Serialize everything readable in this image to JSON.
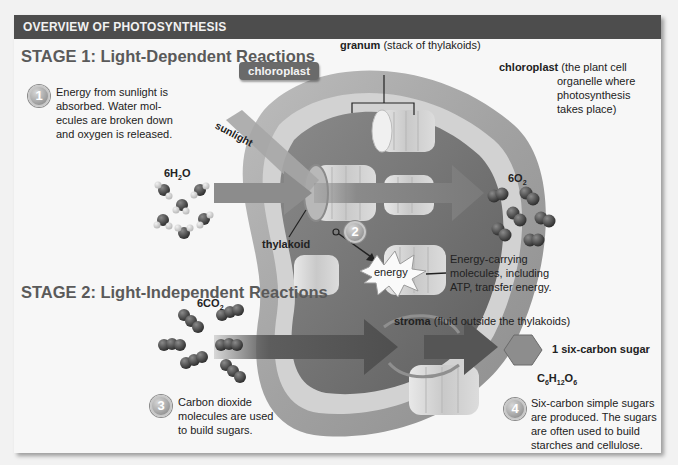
{
  "header": {
    "title": "OVERVIEW OF PHOTOSYNTHESIS"
  },
  "stage1": {
    "title": "STAGE 1: Light-Dependent Reactions",
    "step_number": "1",
    "step_text_lines": [
      "Energy from sunlight is",
      "absorbed. Water mol-",
      "ecules are broken down",
      "and oxygen is released."
    ]
  },
  "stage2": {
    "title": "STAGE 2: Light-Independent Reactions",
    "step_number": "3",
    "step_text_lines": [
      "Carbon dioxide",
      "molecules are used",
      "to build sugars."
    ]
  },
  "step2": {
    "number": "2",
    "energy_label": "energy",
    "description_lines": [
      "Energy-carrying",
      "molecules, including",
      "ATP, transfer energy."
    ]
  },
  "step4": {
    "number": "4",
    "text_lines": [
      "Six-carbon simple sugars",
      "are produced. The sugars",
      "are often used to build",
      "starches and cellulose."
    ]
  },
  "labels": {
    "chloroplast_tag": "chloroplast",
    "chloroplast_term": "chloroplast",
    "chloroplast_def_lines": [
      "(the plant cell",
      "organelle where",
      "photosynthesis",
      "takes place)"
    ],
    "granum_term": "granum",
    "granum_def": "(stack of thylakoids)",
    "thylakoid": "thylakoid",
    "sunlight": "sunlight",
    "stroma_term": "stroma",
    "stroma_def": "(fluid outside the thylakoids)",
    "sugar_label": "1 six-carbon sugar"
  },
  "formulas": {
    "water": {
      "coef": "6H",
      "sub": "2",
      "tail": "O"
    },
    "oxygen": {
      "coef": "6O",
      "sub": "2",
      "tail": ""
    },
    "co2": {
      "coef": "6CO",
      "sub": "2",
      "tail": ""
    },
    "glucose": {
      "c": "C",
      "c_sub": "6",
      "h": "H",
      "h_sub": "12",
      "o": "O",
      "o_sub": "6"
    }
  },
  "colors": {
    "header_bg": "#4d4d4d",
    "panel_bg": "#f7f7f7",
    "stage_title": "#5a5a5a",
    "organelle_outer": "#9a9a9a",
    "organelle_inner": "#6e6e6e",
    "arrow": "#7a7a7a"
  }
}
